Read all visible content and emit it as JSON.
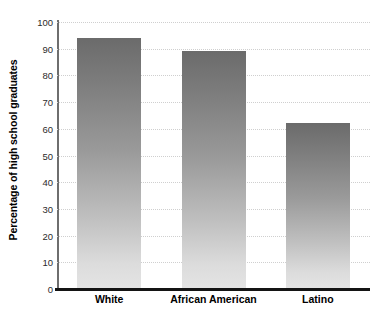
{
  "chart_data": {
    "type": "bar",
    "title": "",
    "xlabel": "",
    "ylabel": "Percentage of high school graduates",
    "categories": [
      "White",
      "African American",
      "Latino"
    ],
    "values": [
      94,
      89,
      62
    ],
    "ylim": [
      0,
      100
    ],
    "y_ticks": [
      0,
      10,
      20,
      30,
      40,
      50,
      60,
      70,
      80,
      90,
      100
    ],
    "y_tick_labels": [
      "0",
      "10",
      "20",
      "30",
      "40",
      "50",
      "60",
      "70",
      "80",
      "90",
      "100"
    ],
    "grid": true,
    "legend": null,
    "bar_style": {
      "gradient_top_color": "#6b6b6b",
      "gradient_bottom_color": "#e4e4e4"
    },
    "axis_style": {
      "baseline_color": "#141414",
      "spine_color": "#6e6e6e",
      "gridline_color": "#cfcfcf"
    },
    "background_color": "#ffffff"
  }
}
